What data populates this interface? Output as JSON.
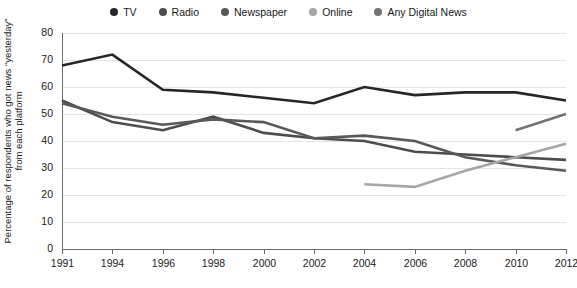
{
  "chart_data": {
    "type": "line",
    "title": "",
    "xlabel": "",
    "ylabel": "Percentage of respondents who got news “yesterday” from each platform",
    "x": [
      1991,
      1994,
      1996,
      1998,
      2000,
      2002,
      2004,
      2006,
      2008,
      2010,
      2012
    ],
    "xtick_labels": [
      "1991",
      "1994",
      "1996",
      "1998",
      "2000",
      "2002",
      "2004",
      "2006",
      "2008",
      "2010",
      "2012"
    ],
    "ytick_labels": [
      "0",
      "10",
      "20",
      "30",
      "40",
      "50",
      "60",
      "70",
      "80"
    ],
    "ytick_values": [
      0,
      10,
      20,
      30,
      40,
      50,
      60,
      70,
      80
    ],
    "xlim": [
      1991,
      2012
    ],
    "ylim": [
      0,
      80
    ],
    "grid": "horizontal",
    "legend_position": "top-center",
    "series": [
      {
        "name": "TV",
        "color": "#262626",
        "x": [
          1991,
          1994,
          1996,
          1998,
          2000,
          2002,
          2004,
          2006,
          2008,
          2010,
          2012
        ],
        "values": [
          68,
          72,
          59,
          58,
          56,
          54,
          60,
          57,
          58,
          58,
          55
        ]
      },
      {
        "name": "Radio",
        "color": "#4d4d4d",
        "x": [
          1991,
          1994,
          1996,
          1998,
          2000,
          2002,
          2004,
          2006,
          2008,
          2010,
          2012
        ],
        "values": [
          55,
          47,
          44,
          49,
          43,
          41,
          40,
          36,
          35,
          34,
          33
        ]
      },
      {
        "name": "Newspaper",
        "color": "#595959",
        "x": [
          1991,
          1994,
          1996,
          1998,
          2000,
          2002,
          2004,
          2006,
          2008,
          2010,
          2012
        ],
        "values": [
          54,
          49,
          46,
          48,
          47,
          41,
          42,
          40,
          34,
          31,
          29
        ]
      },
      {
        "name": "Online",
        "color": "#a6a6a6",
        "x": [
          2004,
          2006,
          2008,
          2010,
          2012
        ],
        "values": [
          24,
          23,
          29,
          34,
          39
        ]
      },
      {
        "name": "Any Digital News",
        "color": "#737373",
        "x": [
          2010,
          2012
        ],
        "values": [
          44,
          50
        ]
      }
    ]
  },
  "legend": {
    "items": [
      {
        "label": "TV",
        "color": "#262626"
      },
      {
        "label": "Radio",
        "color": "#4d4d4d"
      },
      {
        "label": "Newspaper",
        "color": "#595959"
      },
      {
        "label": "Online",
        "color": "#a6a6a6"
      },
      {
        "label": "Any Digital News",
        "color": "#737373"
      }
    ]
  }
}
